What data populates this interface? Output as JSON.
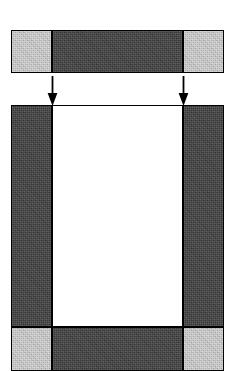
{
  "figure": {
    "canvas": {
      "width": 235,
      "height": 371,
      "background": "#ffffff"
    },
    "palette": {
      "dark": "#3b3b3b",
      "light": "#b6b6b6",
      "white": "#ffffff",
      "outline": "#000000",
      "arrow": "#000000"
    },
    "top_bar": {
      "name": "top-bar",
      "x": 11,
      "y": 30,
      "width": 213,
      "height": 43,
      "segments": [
        {
          "id": "top-left-segment",
          "shade": "light",
          "x": 11,
          "width": 41
        },
        {
          "id": "top-center-segment",
          "shade": "dark",
          "x": 52,
          "width": 131
        },
        {
          "id": "top-right-segment",
          "shade": "light",
          "x": 183,
          "width": 41
        }
      ]
    },
    "arrows": [
      {
        "id": "left-arrow",
        "direction": "down",
        "x": 52,
        "y": 76,
        "length": 29
      },
      {
        "id": "right-arrow",
        "direction": "down",
        "x": 183,
        "y": 76,
        "length": 29
      }
    ],
    "main_frame": {
      "name": "main-frame",
      "x": 11,
      "y": 105,
      "width": 213,
      "height": 266,
      "columns": [
        {
          "id": "frame-left-column",
          "shade": "dark",
          "x": 11,
          "width": 41,
          "y": 105,
          "height": 222
        },
        {
          "id": "frame-center-area",
          "shade": "white",
          "x": 52,
          "width": 131,
          "y": 105,
          "height": 222
        },
        {
          "id": "frame-right-column",
          "shade": "dark",
          "x": 183,
          "width": 41,
          "y": 105,
          "height": 222
        }
      ],
      "bottom_bar": {
        "name": "bottom-bar",
        "y": 327,
        "height": 44,
        "segments": [
          {
            "id": "bottom-left-corner",
            "shade": "light",
            "x": 11,
            "width": 41
          },
          {
            "id": "bottom-center-segment",
            "shade": "dark",
            "x": 52,
            "width": 131
          },
          {
            "id": "bottom-right-corner",
            "shade": "light",
            "x": 183,
            "width": 41
          }
        ]
      }
    },
    "labels": {
      "top_bar_caption": "",
      "main_frame_caption": "",
      "left_arrow_caption": "",
      "right_arrow_caption": ""
    }
  }
}
